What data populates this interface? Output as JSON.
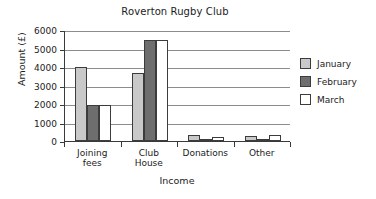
{
  "chart_data": {
    "type": "bar",
    "title": "Roverton Rugby Club",
    "xlabel": "Income",
    "ylabel": "Amount (£)",
    "categories": [
      "Joining\nfees",
      "Club\nHouse",
      "Donations",
      "Other"
    ],
    "series": [
      {
        "name": "January",
        "color": "#c9c9c9",
        "values": [
          4000,
          3700,
          300,
          250
        ]
      },
      {
        "name": "February",
        "color": "#6e6e6e",
        "values": [
          1950,
          5450,
          50,
          80
        ]
      },
      {
        "name": "March",
        "color": "#ffffff",
        "values": [
          1950,
          5450,
          200,
          330
        ]
      }
    ],
    "ylim": [
      0,
      6000
    ],
    "yticks": [
      0,
      1000,
      2000,
      3000,
      4000,
      5000,
      6000
    ],
    "ytick_labels": [
      "0",
      "1000",
      "2000",
      "3000",
      "4000",
      "5000",
      "6000"
    ],
    "grid": true,
    "grid_axis": "y",
    "legend_position": "right",
    "axis_color": "#3a3a3a",
    "grid_color": "#8c8c8c",
    "background": "#ffffff"
  }
}
